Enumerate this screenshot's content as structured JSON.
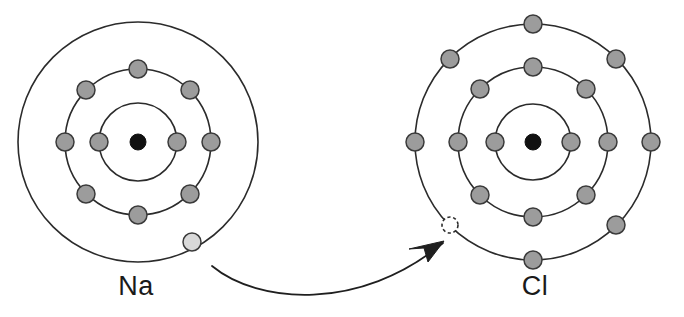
{
  "figure": {
    "background_color": "#ffffff"
  },
  "colors": {
    "shell_stroke": "#2b2b2b",
    "nucleus_fill": "#111111",
    "electron_fill": "#9c9c9c",
    "electron_stroke": "#3a3a3a",
    "valence_electron_fill": "#d9d9d9",
    "vacancy_fill": "#ffffff",
    "arrow_stroke": "#1f1f1f",
    "label_color": "#1a1a1a"
  },
  "atoms": [
    {
      "id": "sodium",
      "label": "Na",
      "label_x": 136,
      "label_y": 295,
      "center_x": 138,
      "center_y": 142,
      "nucleus_radius": 8,
      "shells": [
        {
          "index": 1,
          "radius": 39,
          "electron_count": 2
        },
        {
          "index": 2,
          "radius": 73,
          "electron_count": 8
        },
        {
          "index": 3,
          "radius": 120,
          "electron_count": 1
        }
      ],
      "electrons": [
        {
          "shell": 1,
          "cx": 99,
          "cy": 142,
          "r": 9,
          "state": "filled"
        },
        {
          "shell": 1,
          "cx": 177,
          "cy": 142,
          "r": 9,
          "state": "filled"
        },
        {
          "shell": 2,
          "cx": 65,
          "cy": 142,
          "r": 9,
          "state": "filled"
        },
        {
          "shell": 2,
          "cx": 86,
          "cy": 90,
          "r": 9,
          "state": "filled"
        },
        {
          "shell": 2,
          "cx": 138,
          "cy": 69,
          "r": 9,
          "state": "filled"
        },
        {
          "shell": 2,
          "cx": 190,
          "cy": 90,
          "r": 9,
          "state": "filled"
        },
        {
          "shell": 2,
          "cx": 211,
          "cy": 142,
          "r": 9,
          "state": "filled"
        },
        {
          "shell": 2,
          "cx": 190,
          "cy": 194,
          "r": 9,
          "state": "filled"
        },
        {
          "shell": 2,
          "cx": 138,
          "cy": 215,
          "r": 9,
          "state": "filled"
        },
        {
          "shell": 2,
          "cx": 86,
          "cy": 194,
          "r": 9,
          "state": "filled"
        },
        {
          "shell": 3,
          "cx": 192,
          "cy": 242,
          "r": 9,
          "state": "valence"
        }
      ]
    },
    {
      "id": "chlorine",
      "label": "Cl",
      "label_x": 535,
      "label_y": 295,
      "center_x": 533,
      "center_y": 142,
      "nucleus_radius": 8,
      "shells": [
        {
          "index": 1,
          "radius": 38,
          "electron_count": 2
        },
        {
          "index": 2,
          "radius": 75,
          "electron_count": 8
        },
        {
          "index": 3,
          "radius": 118,
          "electron_count": 7
        }
      ],
      "electrons": [
        {
          "shell": 1,
          "cx": 495,
          "cy": 142,
          "r": 9,
          "state": "filled"
        },
        {
          "shell": 1,
          "cx": 571,
          "cy": 142,
          "r": 9,
          "state": "filled"
        },
        {
          "shell": 2,
          "cx": 458,
          "cy": 142,
          "r": 9,
          "state": "filled"
        },
        {
          "shell": 2,
          "cx": 480,
          "cy": 89,
          "r": 9,
          "state": "filled"
        },
        {
          "shell": 2,
          "cx": 533,
          "cy": 67,
          "r": 9,
          "state": "filled"
        },
        {
          "shell": 2,
          "cx": 586,
          "cy": 89,
          "r": 9,
          "state": "filled"
        },
        {
          "shell": 2,
          "cx": 608,
          "cy": 142,
          "r": 9,
          "state": "filled"
        },
        {
          "shell": 2,
          "cx": 586,
          "cy": 195,
          "r": 9,
          "state": "filled"
        },
        {
          "shell": 2,
          "cx": 533,
          "cy": 217,
          "r": 9,
          "state": "filled"
        },
        {
          "shell": 2,
          "cx": 480,
          "cy": 195,
          "r": 9,
          "state": "filled"
        },
        {
          "shell": 3,
          "cx": 415,
          "cy": 142,
          "r": 9,
          "state": "filled"
        },
        {
          "shell": 3,
          "cx": 450,
          "cy": 59,
          "r": 9,
          "state": "filled"
        },
        {
          "shell": 3,
          "cx": 533,
          "cy": 24,
          "r": 9,
          "state": "filled"
        },
        {
          "shell": 3,
          "cx": 616,
          "cy": 59,
          "r": 9,
          "state": "filled"
        },
        {
          "shell": 3,
          "cx": 651,
          "cy": 142,
          "r": 9,
          "state": "filled"
        },
        {
          "shell": 3,
          "cx": 616,
          "cy": 225,
          "r": 9,
          "state": "filled"
        },
        {
          "shell": 3,
          "cx": 533,
          "cy": 260,
          "r": 9,
          "state": "filled"
        },
        {
          "shell": 3,
          "cx": 450,
          "cy": 225,
          "r": 8,
          "state": "vacancy"
        }
      ]
    }
  ],
  "transfer_arrow": {
    "name": "electron-transfer-arrow",
    "from_atom": "sodium",
    "to_atom": "chlorine",
    "from_point": [
      212,
      266
    ],
    "to_point": [
      443,
      243
    ],
    "path": "M 212 266 C 258 304, 360 312, 443 243",
    "head_points": "443,243 431,262 426,247 410,247"
  }
}
